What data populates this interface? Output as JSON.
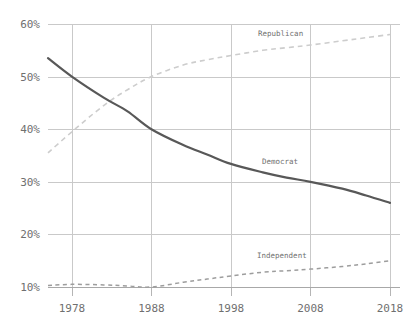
{
  "chart_data": {
    "type": "line",
    "title": "",
    "subtitle": "",
    "xlabel": "",
    "ylabel": "",
    "xlim": [
      1975,
      2018
    ],
    "ylim": [
      10,
      60
    ],
    "grid": true,
    "legend_position": "inline-labels",
    "x_ticks": [
      1978,
      1988,
      1998,
      2008,
      2018
    ],
    "x_tick_labels": [
      "1978",
      "1988",
      "1998",
      "2008",
      "2018"
    ],
    "y_ticks": [
      10,
      20,
      30,
      40,
      50,
      60
    ],
    "y_tick_labels": [
      "10%",
      "20%",
      "30%",
      "40%",
      "50%",
      "60%"
    ],
    "x": [
      1975,
      1978,
      1982,
      1985,
      1988,
      1992,
      1995,
      1998,
      2002,
      2005,
      2008,
      2012,
      2015,
      2018
    ],
    "series": [
      {
        "name": "Democrat",
        "label": "Democrat",
        "style": "solid",
        "color": "#585858",
        "values": [
          53.5,
          50.0,
          46.0,
          43.4,
          40.0,
          37.0,
          35.2,
          33.4,
          31.8,
          30.8,
          30.0,
          28.7,
          27.4,
          26.0
        ]
      },
      {
        "name": "Republican",
        "label": "Republican",
        "style": "dashed",
        "color": "#cdcdcd",
        "values": [
          35.5,
          39.5,
          44.5,
          47.5,
          50.0,
          52.2,
          53.2,
          54.0,
          55.0,
          55.5,
          56.0,
          56.8,
          57.4,
          58.0
        ]
      },
      {
        "name": "Independent",
        "label": "Independent",
        "style": "dashed",
        "color": "#9d9d9d",
        "values": [
          10.3,
          10.5,
          10.4,
          10.2,
          10.0,
          10.9,
          11.5,
          12.1,
          12.8,
          13.1,
          13.4,
          13.9,
          14.4,
          15.0
        ]
      }
    ]
  },
  "labels": {
    "republican": "Republican",
    "democrat": "Democrat",
    "independent": "Independent"
  }
}
